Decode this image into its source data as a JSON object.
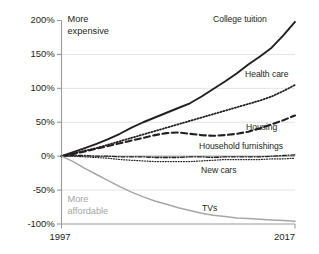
{
  "chart_data": {
    "type": "line",
    "title": "",
    "subtitle": "",
    "xlabel": "",
    "ylabel": "",
    "xlim": [
      1997,
      2017
    ],
    "ylim": [
      -100,
      200
    ],
    "grid": true,
    "legend_position": "inline-right",
    "x_tick_labels": [
      "1997",
      "2017"
    ],
    "y_tick_labels": [
      "200%",
      "150%",
      "100%",
      "50%",
      "0%",
      "-50%",
      "-100%"
    ],
    "y_tick_values": [
      200,
      150,
      100,
      50,
      0,
      -50,
      -100
    ],
    "annotations": [
      {
        "id": "more-expensive",
        "text_line1": "More",
        "text_line2": "expensive",
        "color": "#231f20"
      },
      {
        "id": "more-affordable",
        "text_line1": "More",
        "text_line2": "affordable",
        "color": "#a6a6a6"
      }
    ],
    "x": [
      1997,
      1998,
      1999,
      2000,
      2001,
      2002,
      2003,
      2004,
      2005,
      2006,
      2007,
      2008,
      2009,
      2010,
      2011,
      2012,
      2013,
      2014,
      2015,
      2016,
      2017
    ],
    "series": [
      {
        "name": "College tuition",
        "label": "College tuition",
        "style": "solid",
        "color": "#231f20",
        "width": 1.9,
        "values": [
          0,
          6,
          12,
          18,
          25,
          33,
          42,
          50,
          57,
          64,
          71,
          78,
          88,
          99,
          110,
          122,
          135,
          147,
          160,
          178,
          198
        ]
      },
      {
        "name": "Health care",
        "label": "Health care",
        "style": "dotted",
        "color": "#231f20",
        "width": 1.8,
        "values": [
          0,
          4,
          8,
          12,
          17,
          22,
          27,
          32,
          37,
          42,
          47,
          52,
          57,
          62,
          67,
          72,
          77,
          82,
          88,
          96,
          105
        ]
      },
      {
        "name": "Housing",
        "label": "Housing",
        "style": "dashed",
        "color": "#231f20",
        "width": 2.1,
        "values": [
          0,
          3,
          7,
          11,
          15,
          19,
          23,
          27,
          31,
          34,
          35,
          33,
          31,
          30,
          31,
          33,
          36,
          41,
          47,
          53,
          60
        ]
      },
      {
        "name": "Household furnishings",
        "label": "Household furnishings",
        "style": "dashdot",
        "color": "#231f20",
        "width": 1.3,
        "values": [
          0,
          1,
          1,
          0,
          0,
          -1,
          -1,
          -1,
          -2,
          -2,
          -2,
          -1,
          -1,
          -2,
          -1,
          -1,
          -1,
          -1,
          0,
          1,
          2
        ]
      },
      {
        "name": "New cars",
        "label": "New cars",
        "style": "fine-dotted",
        "color": "#231f20",
        "width": 1.2,
        "values": [
          0,
          0,
          -1,
          -2,
          -3,
          -5,
          -6,
          -7,
          -8,
          -8,
          -8,
          -8,
          -7,
          -6,
          -5,
          -5,
          -5,
          -5,
          -4,
          -4,
          -3
        ]
      },
      {
        "name": "TVs",
        "label": "TVs",
        "style": "solid",
        "color": "#a6a6a6",
        "width": 1.5,
        "values": [
          0,
          -8,
          -18,
          -27,
          -36,
          -45,
          -53,
          -60,
          -66,
          -71,
          -76,
          -80,
          -84,
          -87,
          -89,
          -91,
          -92,
          -93,
          -94,
          -95,
          -96
        ]
      }
    ]
  }
}
